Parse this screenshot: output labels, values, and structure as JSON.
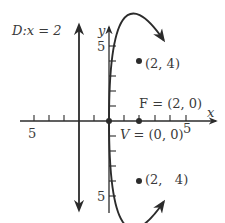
{
  "diagram": {
    "type": "parabola-graph",
    "colors": {
      "ink": "#2b2b2b",
      "text": "#3a3a3a",
      "background": "#ffffff"
    },
    "axes": {
      "x_label": "x",
      "y_label": "y",
      "x_tick_label_neg": "5",
      "x_tick_label_pos": "5",
      "y_tick_label_pos": "5",
      "y_tick_label_neg": "5",
      "x_range": [
        -5,
        5
      ],
      "y_range": [
        -5,
        5
      ],
      "tick_step": 1
    },
    "directrix": {
      "label": "D:x =  2",
      "x": -2
    },
    "focus": {
      "label": "F = (2, 0)",
      "x": 2,
      "y": 0
    },
    "vertex": {
      "label": "V = (0, 0)",
      "x": 0,
      "y": 0
    },
    "points": [
      {
        "label": "(2, 4)",
        "x": 2,
        "y": 4
      },
      {
        "label": "(2,   4)",
        "x": 2,
        "y": -4
      }
    ],
    "curve": {
      "equation": "y^2 = 8x"
    }
  }
}
